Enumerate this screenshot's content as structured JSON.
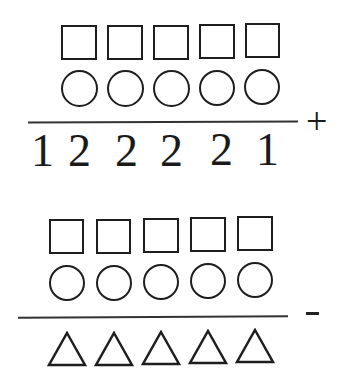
{
  "problem1": {
    "row_squares": [
      "square",
      "square",
      "square",
      "square",
      "square"
    ],
    "row_circles": [
      "circle",
      "circle",
      "circle",
      "circle",
      "circle"
    ],
    "result_digits": [
      "1",
      "2",
      "2",
      "2",
      "2",
      "1"
    ],
    "operator": "+"
  },
  "problem2": {
    "row_squares": [
      "square",
      "square",
      "square",
      "square",
      "square"
    ],
    "row_circles": [
      "circle",
      "circle",
      "circle",
      "circle",
      "circle"
    ],
    "result_triangles": [
      "triangle",
      "triangle",
      "triangle",
      "triangle",
      "triangle"
    ],
    "operator": "-"
  }
}
